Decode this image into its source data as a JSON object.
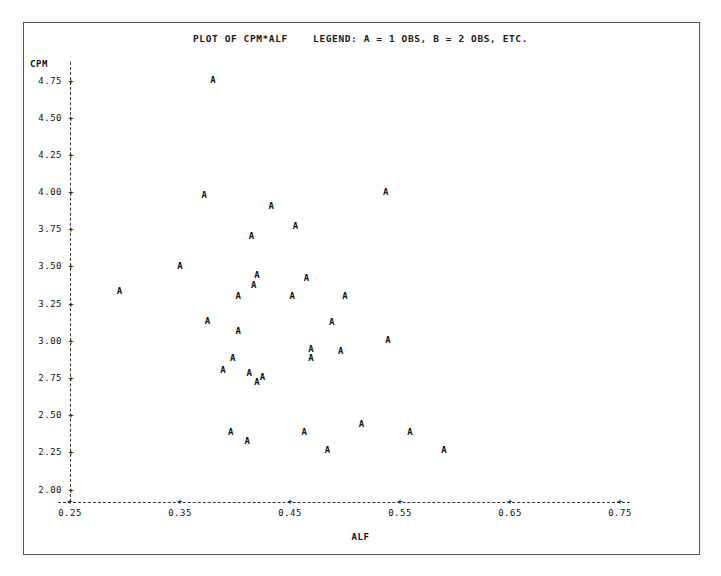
{
  "plot": {
    "title": "PLOT OF CPM*ALF    LEGEND: A = 1 OBS, B = 2 OBS, ETC.",
    "point_symbol": "A",
    "tick_symbol": "+",
    "frame_color": "#555555",
    "text_color": "#111111"
  },
  "chart_data": {
    "type": "scatter",
    "title": "PLOT OF CPM*ALF    LEGEND: A = 1 OBS, B = 2 OBS, ETC.",
    "xlabel": "ALF",
    "ylabel": "CPM",
    "xlim": [
      0.25,
      0.75
    ],
    "ylim": [
      2.0,
      4.75
    ],
    "grid": false,
    "legend": "A = 1 OBS, B = 2 OBS, ETC.",
    "legend_position": "title",
    "xticks": [
      0.25,
      0.35,
      0.45,
      0.55,
      0.65,
      0.75
    ],
    "xtick_labels": [
      "0.25",
      "0.35",
      "0.45",
      "0.55",
      "0.65",
      "0.75"
    ],
    "yticks": [
      2.0,
      2.25,
      2.5,
      2.75,
      3.0,
      3.25,
      3.5,
      3.75,
      4.0,
      4.25,
      4.5,
      4.75
    ],
    "ytick_labels": [
      "2.00",
      "2.25",
      "2.50",
      "2.75",
      "3.00",
      "3.25",
      "3.50",
      "3.75",
      "4.00",
      "4.25",
      "4.50",
      "4.75"
    ],
    "marker_labels": [
      "A"
    ],
    "points": [
      {
        "x": 0.38,
        "y": 4.75,
        "label": "A"
      },
      {
        "x": 0.372,
        "y": 3.98,
        "label": "A"
      },
      {
        "x": 0.537,
        "y": 4.0,
        "label": "A"
      },
      {
        "x": 0.433,
        "y": 3.9,
        "label": "A"
      },
      {
        "x": 0.455,
        "y": 3.77,
        "label": "A"
      },
      {
        "x": 0.415,
        "y": 3.7,
        "label": "A"
      },
      {
        "x": 0.35,
        "y": 3.5,
        "label": "A"
      },
      {
        "x": 0.42,
        "y": 3.44,
        "label": "A"
      },
      {
        "x": 0.417,
        "y": 3.37,
        "label": "A"
      },
      {
        "x": 0.465,
        "y": 3.42,
        "label": "A"
      },
      {
        "x": 0.295,
        "y": 3.33,
        "label": "A"
      },
      {
        "x": 0.403,
        "y": 3.3,
        "label": "A"
      },
      {
        "x": 0.452,
        "y": 3.3,
        "label": "A"
      },
      {
        "x": 0.5,
        "y": 3.3,
        "label": "A"
      },
      {
        "x": 0.375,
        "y": 3.13,
        "label": "A"
      },
      {
        "x": 0.488,
        "y": 3.12,
        "label": "A"
      },
      {
        "x": 0.403,
        "y": 3.06,
        "label": "A"
      },
      {
        "x": 0.539,
        "y": 3.0,
        "label": "A"
      },
      {
        "x": 0.469,
        "y": 2.94,
        "label": "A"
      },
      {
        "x": 0.496,
        "y": 2.93,
        "label": "A"
      },
      {
        "x": 0.398,
        "y": 2.88,
        "label": "A"
      },
      {
        "x": 0.469,
        "y": 2.88,
        "label": "A"
      },
      {
        "x": 0.389,
        "y": 2.8,
        "label": "A"
      },
      {
        "x": 0.413,
        "y": 2.78,
        "label": "A"
      },
      {
        "x": 0.425,
        "y": 2.75,
        "label": "A"
      },
      {
        "x": 0.42,
        "y": 2.72,
        "label": "A"
      },
      {
        "x": 0.396,
        "y": 2.38,
        "label": "A"
      },
      {
        "x": 0.463,
        "y": 2.38,
        "label": "A"
      },
      {
        "x": 0.515,
        "y": 2.44,
        "label": "A"
      },
      {
        "x": 0.559,
        "y": 2.38,
        "label": "A"
      },
      {
        "x": 0.411,
        "y": 2.32,
        "label": "A"
      },
      {
        "x": 0.484,
        "y": 2.26,
        "label": "A"
      },
      {
        "x": 0.59,
        "y": 2.26,
        "label": "A"
      }
    ]
  }
}
